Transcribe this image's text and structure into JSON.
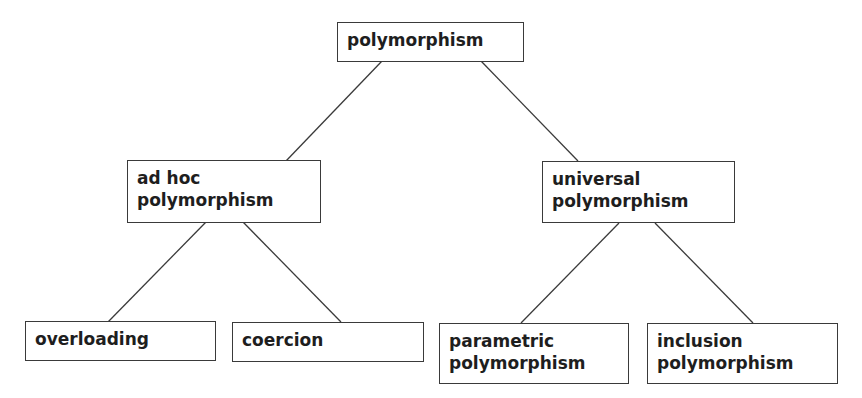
{
  "diagram": {
    "type": "tree",
    "colors": {
      "border": "#3a3a3a",
      "text": "#1e1e1e",
      "background": "#ffffff",
      "edge": "#3a3a3a"
    },
    "nodes": {
      "root": {
        "label": "polymorphism"
      },
      "adhoc": {
        "label": "ad hoc\npolymorphism"
      },
      "universal": {
        "label": "universal\npolymorphism"
      },
      "overloading": {
        "label": "overloading"
      },
      "coercion": {
        "label": "coercion"
      },
      "parametric": {
        "label": "parametric\npolymorphism"
      },
      "inclusion": {
        "label": "inclusion\npolymorphism"
      }
    },
    "edges": [
      {
        "from": "polymorphism",
        "to": "ad hoc polymorphism"
      },
      {
        "from": "polymorphism",
        "to": "universal polymorphism"
      },
      {
        "from": "ad hoc polymorphism",
        "to": "overloading"
      },
      {
        "from": "ad hoc polymorphism",
        "to": "coercion"
      },
      {
        "from": "universal polymorphism",
        "to": "parametric polymorphism"
      },
      {
        "from": "universal polymorphism",
        "to": "inclusion polymorphism"
      }
    ]
  }
}
